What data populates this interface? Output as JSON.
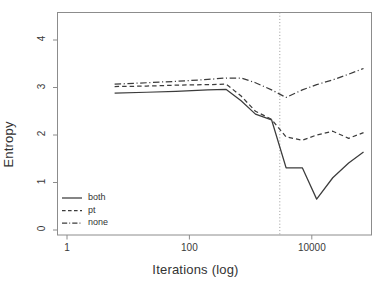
{
  "chart_data": {
    "type": "line",
    "title": "",
    "xlabel": "Iterations (log)",
    "ylabel": "Entropy",
    "xscale": "log",
    "xlim": [
      1,
      100000
    ],
    "ylim": [
      -0.18,
      4.55
    ],
    "xticks": [
      1,
      100,
      10000
    ],
    "xtick_labels": [
      "1",
      "100",
      "10000"
    ],
    "yticks": [
      0,
      1,
      2,
      3,
      4
    ],
    "ytick_labels": [
      "0",
      "1",
      "2",
      "3",
      "4"
    ],
    "grid": false,
    "legend_position": "bottom-left",
    "annotations": [
      {
        "type": "vline",
        "x": 3000,
        "style": "dotted",
        "color": "#999999"
      }
    ],
    "x": [
      6,
      20,
      60,
      200,
      400,
      700,
      1200,
      2200,
      3800,
      7000,
      12000,
      22000,
      40000,
      70000
    ],
    "series": [
      {
        "name": "both",
        "style": "solid",
        "color": "#3c3c3c",
        "values": [
          2.88,
          2.9,
          2.92,
          2.95,
          2.96,
          2.72,
          2.44,
          2.32,
          1.31,
          1.31,
          0.65,
          1.1,
          1.41,
          1.64
        ]
      },
      {
        "name": "pt",
        "style": "dashed",
        "color": "#3c3c3c",
        "values": [
          3.02,
          3.03,
          3.05,
          3.06,
          3.07,
          2.82,
          2.5,
          2.33,
          1.96,
          1.89,
          2.0,
          2.08,
          1.93,
          2.05
        ]
      },
      {
        "name": "none",
        "style": "dashdot",
        "color": "#3c3c3c",
        "values": [
          3.07,
          3.1,
          3.13,
          3.17,
          3.2,
          3.2,
          3.1,
          2.95,
          2.79,
          2.95,
          3.06,
          3.16,
          3.28,
          3.4
        ]
      }
    ]
  },
  "legend": {
    "items": [
      {
        "label": "both",
        "style": "solid"
      },
      {
        "label": "pt",
        "style": "dashed"
      },
      {
        "label": "none",
        "style": "dashdot"
      }
    ]
  }
}
